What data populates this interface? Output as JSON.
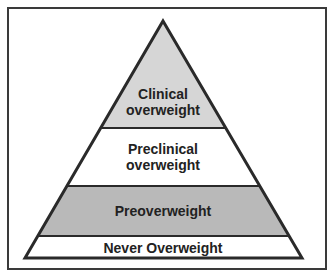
{
  "diagram": {
    "type": "pyramid",
    "levels": [
      {
        "id": "clinical",
        "lines": [
          "Clinical",
          "overweight"
        ],
        "fill": "#d6d6d6"
      },
      {
        "id": "preclinical",
        "lines": [
          "Preclinical",
          "overweight"
        ],
        "fill": "#ffffff"
      },
      {
        "id": "preoverweight",
        "lines": [
          "Preoverweight"
        ],
        "fill": "#b9b9b9"
      },
      {
        "id": "never-overweight",
        "lines": [
          "Never Overweight"
        ],
        "fill": "#ffffff"
      }
    ],
    "colors": {
      "outline": "#2a2a2a",
      "frame": "#3a3a3a",
      "text": "#222222"
    }
  }
}
